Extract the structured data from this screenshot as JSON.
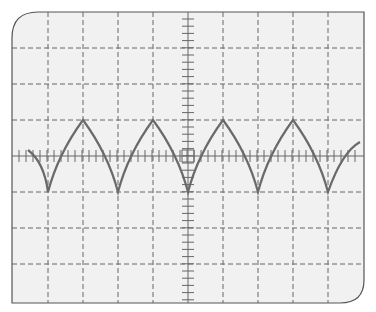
{
  "screen": {
    "title": "Oscilloscope display",
    "background": "#f1f1f1",
    "border_color": "#555555",
    "grid_color": "#666666",
    "trace_color": "#6a6a6a",
    "divisions_x": 10,
    "divisions_y": 8,
    "minor_ticks_per_division": 5
  },
  "waveform": {
    "type": "cusp wave (rectified arc)",
    "peaks_x_div": [
      2,
      4,
      6,
      8
    ],
    "troughs_x_div": [
      1,
      3,
      5,
      7,
      9
    ],
    "amplitude_div": 1,
    "period_div": 2
  }
}
